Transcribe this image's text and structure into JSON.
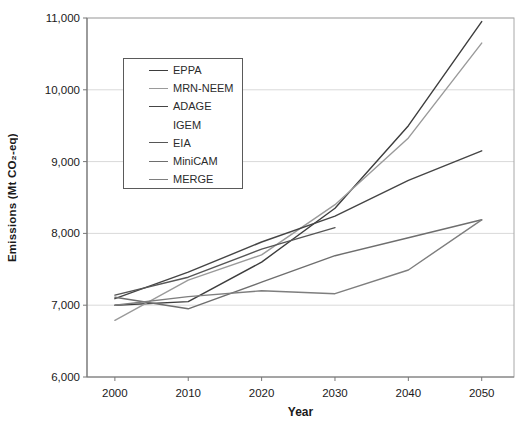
{
  "chart_data": {
    "type": "line",
    "title": "",
    "xlabel": "Year",
    "ylabel": "Emissions (Mt CO₂-eq)",
    "xlim": [
      1996.2,
      2054.4
    ],
    "ylim": [
      6000,
      11000
    ],
    "x": [
      2000,
      2010,
      2020,
      2030,
      2040,
      2050
    ],
    "xticks": [
      2000,
      2010,
      2020,
      2030,
      2040,
      2050
    ],
    "xtick_labels": [
      "2000",
      "2010",
      "2020",
      "2030",
      "2040",
      "2050"
    ],
    "yticks": [
      6000,
      7000,
      8000,
      9000,
      10000,
      11000
    ],
    "ytick_labels": [
      "6,000",
      "7,000",
      "8,000",
      "9,000",
      "10,000",
      "11,000"
    ],
    "grid": "horizontal",
    "legend_position": "upper-left-inside",
    "colors": {
      "grid": "#d9d9d9",
      "plot_border": "#a8a8a8",
      "axis": "#777777",
      "tick_text": "#1a1a1a"
    },
    "series": [
      {
        "name": "EPPA",
        "color": "#3d3d3d",
        "values": [
          7000,
          7050,
          7600,
          8350,
          9500,
          10950
        ]
      },
      {
        "name": "MRN-NEEM",
        "color": "#9a9a9a",
        "values": [
          6790,
          7350,
          7700,
          8400,
          9330,
          10650
        ]
      },
      {
        "name": "ADAGE",
        "color": "#454545",
        "values": [
          7090,
          7460,
          7880,
          8240,
          8740,
          9150
        ]
      },
      {
        "name": "IGEM",
        "color": null,
        "values": null,
        "note": "line not visible in figure"
      },
      {
        "name": "EIA",
        "color": "#565656",
        "values": [
          7140,
          7390,
          7780,
          8080,
          null,
          null
        ]
      },
      {
        "name": "MiniCAM",
        "color": "#6e6e6e",
        "values": [
          7110,
          6950,
          7320,
          7690,
          7940,
          8190
        ]
      },
      {
        "name": "MERGE",
        "color": "#7e7e7e",
        "values": [
          7000,
          7120,
          7200,
          7160,
          7490,
          8190
        ]
      }
    ]
  }
}
